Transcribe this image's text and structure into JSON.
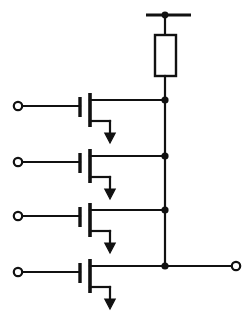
{
  "diagram": {
    "background_color": "#ffffff",
    "line_color": "#111111",
    "canvas": {
      "width": 252,
      "height": 315
    }
  },
  "supply": {
    "label": "VDD",
    "rail": {
      "x1": 146,
      "y": 15,
      "x2": 191
    },
    "drop": {
      "x": 165,
      "y1": 15,
      "y2": 35
    },
    "junction": {
      "cx": 165,
      "cy": 15,
      "r": 3.4
    }
  },
  "resistor": {
    "name": "pull-up-resistor",
    "box": {
      "x": 155,
      "y": 35,
      "width": 21,
      "height": 41
    },
    "lead_bottom": {
      "x": 165,
      "y1": 76,
      "y2": 100
    }
  },
  "output_bus": {
    "name": "output-bus",
    "x": 165,
    "y_top": 100,
    "y_bottom": 266
  },
  "output_terminal": {
    "label": "OUT",
    "wire": {
      "x1": 165,
      "y": 266,
      "x2": 232
    },
    "ring": {
      "cx": 236,
      "cy": 266,
      "r": 4.2
    }
  },
  "transistors": [
    {
      "name": "transistor-1",
      "input_label": "A",
      "input_ring": {
        "cx": 18,
        "cy": 106,
        "r": 4.2
      },
      "gate_wire": {
        "x1": 22,
        "y": 106,
        "x2": 80
      },
      "gate_bar": {
        "x": 80,
        "y1": 97,
        "y2": 117
      },
      "channel_bar": {
        "x": 90,
        "y1": 93,
        "y2": 127
      },
      "drain_wire": {
        "x1": 90,
        "y": 100,
        "x2": 165
      },
      "source_wire_h": {
        "x1": 90,
        "y": 121,
        "x2": 110
      },
      "source_wire_v": {
        "x": 110,
        "y1": 121,
        "y2": 134
      },
      "arrow": {
        "cx": 110,
        "tip_y": 143,
        "half_width": 5.2,
        "base_y": 133
      },
      "node_dot": {
        "cx": 165,
        "cy": 100,
        "r": 3.6
      }
    },
    {
      "name": "transistor-2",
      "input_label": "B",
      "input_ring": {
        "cx": 18,
        "cy": 162,
        "r": 4.2
      },
      "gate_wire": {
        "x1": 22,
        "y": 162,
        "x2": 80
      },
      "gate_bar": {
        "x": 80,
        "y1": 153,
        "y2": 173
      },
      "channel_bar": {
        "x": 90,
        "y1": 149,
        "y2": 183
      },
      "drain_wire": {
        "x1": 90,
        "y": 156,
        "x2": 165
      },
      "source_wire_h": {
        "x1": 90,
        "y": 177,
        "x2": 110
      },
      "source_wire_v": {
        "x": 110,
        "y1": 177,
        "y2": 190
      },
      "arrow": {
        "cx": 110,
        "tip_y": 199,
        "half_width": 5.2,
        "base_y": 189
      },
      "node_dot": {
        "cx": 165,
        "cy": 156,
        "r": 3.6
      }
    },
    {
      "name": "transistor-3",
      "input_label": "C",
      "input_ring": {
        "cx": 18,
        "cy": 216,
        "r": 4.2
      },
      "gate_wire": {
        "x1": 22,
        "y": 216,
        "x2": 80
      },
      "gate_bar": {
        "x": 80,
        "y1": 207,
        "y2": 227
      },
      "channel_bar": {
        "x": 90,
        "y1": 203,
        "y2": 237
      },
      "drain_wire": {
        "x1": 90,
        "y": 210,
        "x2": 165
      },
      "source_wire_h": {
        "x1": 90,
        "y": 231,
        "x2": 110
      },
      "source_wire_v": {
        "x": 110,
        "y1": 231,
        "y2": 244
      },
      "arrow": {
        "cx": 110,
        "tip_y": 253,
        "half_width": 5.2,
        "base_y": 243
      },
      "node_dot": {
        "cx": 165,
        "cy": 210,
        "r": 3.6
      }
    },
    {
      "name": "transistor-4",
      "input_label": "D",
      "input_ring": {
        "cx": 18,
        "cy": 272,
        "r": 4.2
      },
      "gate_wire": {
        "x1": 22,
        "y": 272,
        "x2": 80
      },
      "gate_bar": {
        "x": 80,
        "y1": 263,
        "y2": 283
      },
      "channel_bar": {
        "x": 90,
        "y1": 259,
        "y2": 293
      },
      "drain_wire": {
        "x1": 90,
        "y": 266,
        "x2": 165
      },
      "source_wire_h": {
        "x1": 90,
        "y": 287,
        "x2": 110
      },
      "source_wire_v": {
        "x": 110,
        "y1": 287,
        "y2": 300
      },
      "arrow": {
        "cx": 110,
        "tip_y": 309,
        "half_width": 5.2,
        "base_y": 299
      },
      "node_dot": {
        "cx": 165,
        "cy": 266,
        "r": 3.6
      }
    }
  ]
}
